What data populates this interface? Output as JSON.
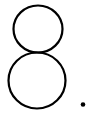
{
  "glyph": {
    "text": "8.",
    "character": "8",
    "punctuation": ".",
    "stroke_color": "#000000",
    "background_color": "#ffffff"
  }
}
